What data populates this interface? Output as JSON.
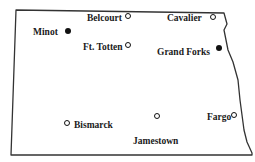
{
  "map": {
    "region": "North Dakota outline",
    "outline_color": "#333333",
    "marker_color": "#111111",
    "cities": [
      {
        "name": "Minot",
        "marker": "filled",
        "label_x": 33,
        "label_y": 28,
        "marker_x": 68,
        "marker_y": 31
      },
      {
        "name": "Belcourt",
        "marker": "open",
        "label_x": 87,
        "label_y": 14,
        "marker_x": 128,
        "marker_y": 16
      },
      {
        "name": "Cavalier",
        "marker": "open",
        "label_x": 167,
        "label_y": 14,
        "marker_x": 213,
        "marker_y": 17
      },
      {
        "name": "Ft. Totten",
        "marker": "open",
        "label_x": 83,
        "label_y": 43,
        "marker_x": 128,
        "marker_y": 45
      },
      {
        "name": "Grand Forks",
        "marker": "filled",
        "label_x": 157,
        "label_y": 48,
        "marker_x": 219,
        "marker_y": 48
      },
      {
        "name": "Bismarck",
        "marker": "open",
        "label_x": 74,
        "label_y": 121,
        "marker_x": 67,
        "marker_y": 123
      },
      {
        "name": "Jamestown",
        "marker": "open",
        "label_x": 133,
        "label_y": 137,
        "marker_x": 157,
        "marker_y": 116
      },
      {
        "name": "Fargo",
        "marker": "open",
        "label_x": 207,
        "label_y": 113,
        "marker_x": 234,
        "marker_y": 115
      }
    ]
  }
}
